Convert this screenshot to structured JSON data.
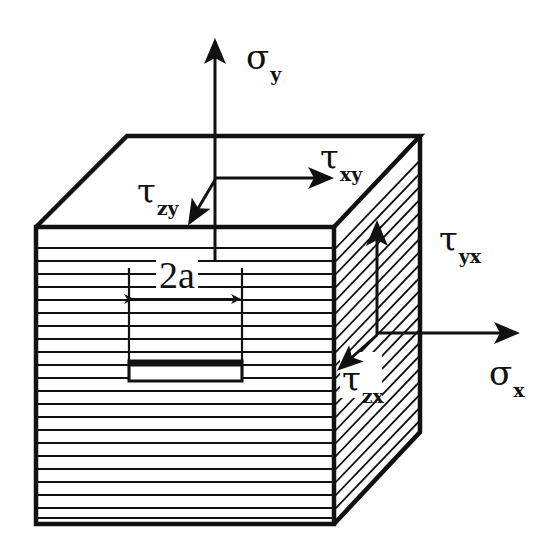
{
  "diagram": {
    "type": "stress-element-cube",
    "colors": {
      "ink": "#111111",
      "background": "#ffffff"
    },
    "cube": {
      "front_face": {
        "hatch": "horizontal",
        "corners": [
          [
            36,
            227
          ],
          [
            334,
            227
          ],
          [
            334,
            524
          ],
          [
            36,
            524
          ]
        ]
      },
      "top_face": {
        "hatch": "none",
        "corners": [
          [
            36,
            227
          ],
          [
            127,
            136
          ],
          [
            420,
            136
          ],
          [
            334,
            227
          ]
        ]
      },
      "right_face": {
        "hatch": "diagonal",
        "corners": [
          [
            334,
            227
          ],
          [
            420,
            136
          ],
          [
            420,
            432
          ],
          [
            334,
            524
          ]
        ]
      }
    },
    "crack": {
      "label": "2a",
      "description": "through-crack of width 2a on front face"
    },
    "labels": {
      "sigma_y": {
        "symbol": "σ",
        "subscript": "y"
      },
      "tau_xy": {
        "symbol": "τ",
        "subscript": "xy"
      },
      "tau_zy": {
        "symbol": "τ",
        "subscript": "zy"
      },
      "tau_yx": {
        "symbol": "τ",
        "subscript": "yx"
      },
      "sigma_x": {
        "symbol": "σ",
        "subscript": "x"
      },
      "tau_zx": {
        "symbol": "τ",
        "subscript": "zx"
      }
    },
    "arrows": [
      {
        "name": "sigma-y-arrow",
        "from": [
          215,
          262
        ],
        "to": [
          215,
          40
        ]
      },
      {
        "name": "tau-xy-arrow",
        "from": [
          215,
          178
        ],
        "to": [
          332,
          178
        ]
      },
      {
        "name": "tau-zy-arrow",
        "from": [
          215,
          180
        ],
        "to": [
          188,
          224
        ]
      },
      {
        "name": "tau-yx-arrow",
        "from": [
          377,
          335
        ],
        "to": [
          377,
          222
        ]
      },
      {
        "name": "sigma-x-arrow",
        "from": [
          377,
          333
        ],
        "to": [
          518,
          333
        ]
      },
      {
        "name": "tau-zx-arrow",
        "from": [
          377,
          335
        ],
        "to": [
          338,
          370
        ]
      }
    ]
  }
}
